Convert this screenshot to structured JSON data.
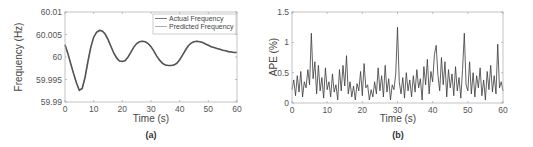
{
  "chart_data": [
    {
      "id": "a",
      "type": "line",
      "caption": "(a)",
      "title": "",
      "xlabel": "Time (s)",
      "ylabel": "Frequency (Hz)",
      "xlim": [
        0,
        60
      ],
      "ylim": [
        59.99,
        60.01
      ],
      "xticks": [
        0,
        10,
        20,
        30,
        40,
        50,
        60
      ],
      "xtick_labels": [
        "0",
        "10",
        "20",
        "30",
        "40",
        "50",
        "60"
      ],
      "yticks": [
        59.99,
        59.995,
        60,
        60.005,
        60.01
      ],
      "ytick_labels": [
        "59.99",
        "59.995",
        "60",
        "60.005",
        "60.01"
      ],
      "grid": false,
      "legend": {
        "position": "upper right",
        "entries": [
          "Actual Frequency",
          "Predicted Frequency"
        ]
      },
      "x": [
        0,
        1,
        2,
        3,
        4,
        5,
        6,
        7,
        8,
        9,
        10,
        11,
        12,
        13,
        14,
        15,
        16,
        17,
        18,
        19,
        20,
        21,
        22,
        23,
        24,
        25,
        26,
        27,
        28,
        29,
        30,
        31,
        32,
        33,
        34,
        35,
        36,
        37,
        38,
        39,
        40,
        41,
        42,
        43,
        44,
        45,
        46,
        47,
        48,
        49,
        50,
        51,
        52,
        53,
        54,
        55,
        56,
        57,
        58,
        59,
        60
      ],
      "series": [
        {
          "name": "Actual Frequency",
          "color": "#555555",
          "values": [
            60.0027,
            60.0008,
            59.9985,
            59.9963,
            59.9942,
            59.9926,
            59.993,
            59.9955,
            59.999,
            60.0022,
            60.0044,
            60.0055,
            60.0059,
            60.0058,
            60.0051,
            60.0039,
            60.0024,
            60.0009,
            59.9998,
            59.9991,
            59.999,
            59.9992,
            60.0,
            60.0011,
            60.0022,
            60.003,
            60.0034,
            60.0035,
            60.0034,
            60.003,
            60.0023,
            60.0013,
            60.0002,
            59.9993,
            59.9986,
            59.9982,
            59.9981,
            59.9981,
            59.9982,
            59.9986,
            59.9994,
            60.0004,
            60.0015,
            60.0025,
            60.0031,
            60.0034,
            60.0035,
            60.0034,
            60.0032,
            60.0029,
            60.0026,
            60.0023,
            60.0021,
            60.0019,
            60.0017,
            60.0015,
            60.0014,
            60.0012,
            60.0011,
            60.001,
            60.001
          ]
        },
        {
          "name": "Predicted Frequency",
          "color": "#9a9a9a",
          "values": [
            60.0027,
            60.0008,
            59.9985,
            59.9963,
            59.9942,
            59.9926,
            59.993,
            59.9955,
            59.999,
            60.0022,
            60.0044,
            60.0055,
            60.0059,
            60.0058,
            60.0051,
            60.0039,
            60.0024,
            60.0009,
            59.9998,
            59.9991,
            59.999,
            59.9992,
            60.0,
            60.0011,
            60.0022,
            60.003,
            60.0034,
            60.0035,
            60.0034,
            60.003,
            60.0023,
            60.0013,
            60.0002,
            59.9993,
            59.9986,
            59.9982,
            59.9981,
            59.9981,
            59.9982,
            59.9986,
            59.9994,
            60.0004,
            60.0015,
            60.0025,
            60.0031,
            60.0034,
            60.0035,
            60.0034,
            60.0032,
            60.0029,
            60.0026,
            60.0023,
            60.0021,
            60.0019,
            60.0017,
            60.0015,
            60.0014,
            60.0012,
            60.0011,
            60.001,
            60.001
          ]
        }
      ]
    },
    {
      "id": "b",
      "type": "line",
      "caption": "(b)",
      "title": "",
      "xlabel": "Time (s)",
      "ylabel": "APE (%)",
      "xlim": [
        0,
        60
      ],
      "ylim": [
        0,
        1.5
      ],
      "xticks": [
        0,
        10,
        20,
        30,
        40,
        50,
        60
      ],
      "xtick_labels": [
        "0",
        "10",
        "20",
        "30",
        "40",
        "50",
        "60"
      ],
      "yticks": [
        0,
        0.5,
        1,
        1.5
      ],
      "ytick_labels": [
        "0",
        "0.5",
        "1",
        "1.5"
      ],
      "grid": false,
      "legend": null,
      "x": [
        0,
        0.5,
        1,
        1.5,
        2,
        2.5,
        3,
        3.5,
        4,
        4.5,
        5,
        5.5,
        6,
        6.5,
        7,
        7.5,
        8,
        8.5,
        9,
        9.5,
        10,
        10.5,
        11,
        11.5,
        12,
        12.5,
        13,
        13.5,
        14,
        14.5,
        15,
        15.5,
        16,
        16.5,
        17,
        17.5,
        18,
        18.5,
        19,
        19.5,
        20,
        20.5,
        21,
        21.5,
        22,
        22.5,
        23,
        23.5,
        24,
        24.5,
        25,
        25.5,
        26,
        26.5,
        27,
        27.5,
        28,
        28.5,
        29,
        29.5,
        30,
        30.5,
        31,
        31.5,
        32,
        32.5,
        33,
        33.5,
        34,
        34.5,
        35,
        35.5,
        36,
        36.5,
        37,
        37.5,
        38,
        38.5,
        39,
        39.5,
        40,
        40.5,
        41,
        41.5,
        42,
        42.5,
        43,
        43.5,
        44,
        44.5,
        45,
        45.5,
        46,
        46.5,
        47,
        47.5,
        48,
        48.5,
        49,
        49.5,
        50,
        50.5,
        51,
        51.5,
        52,
        52.5,
        53,
        53.5,
        54,
        54.5,
        55,
        55.5,
        56,
        56.5,
        57,
        57.5,
        58,
        58.5,
        59,
        59.5,
        60
      ],
      "series": [
        {
          "name": "APE",
          "color": "#3a3a3a",
          "values": [
            0.22,
            0.38,
            0.12,
            0.45,
            0.18,
            0.52,
            0.1,
            0.35,
            0.25,
            0.55,
            0.3,
            1.15,
            0.4,
            0.68,
            0.15,
            0.62,
            0.2,
            0.42,
            0.08,
            0.58,
            0.22,
            0.35,
            0.1,
            0.48,
            0.18,
            0.3,
            0.05,
            0.55,
            0.2,
            0.62,
            0.28,
            0.78,
            0.15,
            0.35,
            0.1,
            0.28,
            0.05,
            0.32,
            0.2,
            0.52,
            0.12,
            0.65,
            0.25,
            0.3,
            0.05,
            0.22,
            0.1,
            0.35,
            0.15,
            0.58,
            0.2,
            0.45,
            0.1,
            0.62,
            0.18,
            0.4,
            0.05,
            0.3,
            0.22,
            0.48,
            1.25,
            0.35,
            0.15,
            0.42,
            0.08,
            0.5,
            0.2,
            0.38,
            0.1,
            0.45,
            0.18,
            0.55,
            0.25,
            0.4,
            0.05,
            0.6,
            0.3,
            0.72,
            0.15,
            0.52,
            0.35,
            0.8,
            0.95,
            0.45,
            0.2,
            0.75,
            0.3,
            0.68,
            0.1,
            0.55,
            0.25,
            0.48,
            0.12,
            0.6,
            0.2,
            0.42,
            0.08,
            0.55,
            1.15,
            0.3,
            0.2,
            0.68,
            0.15,
            0.5,
            0.1,
            0.45,
            0.25,
            0.58,
            0.12,
            0.38,
            0.05,
            0.52,
            0.22,
            0.62,
            0.18,
            0.45,
            0.15,
            0.97,
            0.25,
            0.35,
            0.2
          ]
        }
      ]
    }
  ]
}
